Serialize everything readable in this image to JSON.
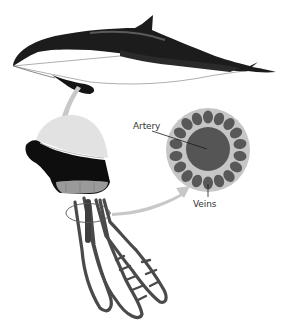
{
  "diagram": {
    "labels": {
      "artery": "Artery",
      "veins": "Veins"
    },
    "parts": [
      {
        "id": "porpoise",
        "description": "side view of porpoise/dolphin"
      },
      {
        "id": "flipper-slice",
        "description": "cut section of flipper"
      },
      {
        "id": "vessel-bundle",
        "description": "branching blood vessels with central artery"
      },
      {
        "id": "cross-section",
        "description": "circular cross-section: central artery surrounded by ring of veins"
      }
    ],
    "vein_count": 18,
    "colors": {
      "body_dark": "#1a1a1a",
      "belly": "#ffffff",
      "arrow": "#c8c8c8",
      "ring": "#c6c6c6",
      "vein": "#585858",
      "artery": "#555555",
      "vessel": "#4a4a4a",
      "label": "#333333"
    }
  }
}
